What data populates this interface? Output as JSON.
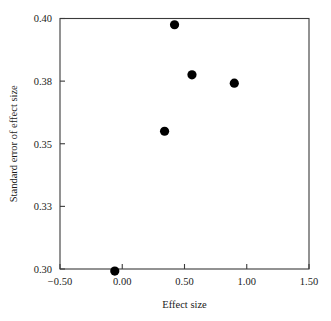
{
  "chart_data": {
    "type": "scatter",
    "title": "",
    "xlabel": "Effect size",
    "ylabel": "Standard error of effect size",
    "xlim": [
      -0.5,
      1.5
    ],
    "ylim": [
      0.3,
      0.4
    ],
    "y_axis_inverted": false,
    "grid": false,
    "legend": null,
    "legend_position": "none",
    "marker": "filled-circle",
    "marker_color": "#000000",
    "marker_size_px": 4.6,
    "xticks": [
      -0.5,
      0.0,
      0.5,
      1.0,
      1.5
    ],
    "xtick_labels": [
      "−0.50",
      "0.00",
      "0.50",
      "1.00",
      "1.50"
    ],
    "yticks": [
      0.3,
      0.33,
      0.35,
      0.38,
      0.4
    ],
    "ytick_labels": [
      "0.30",
      "0.33",
      "0.35",
      "0.38",
      "0.40"
    ],
    "points": [
      {
        "x": -0.06,
        "y": 0.299
      },
      {
        "x": 0.34,
        "y": 0.356
      },
      {
        "x": 0.42,
        "y": 0.398
      },
      {
        "x": 0.56,
        "y": 0.382
      },
      {
        "x": 0.9,
        "y": 0.379
      }
    ],
    "x": [
      -0.06,
      0.34,
      0.42,
      0.56,
      0.9
    ],
    "values": [
      0.299,
      0.356,
      0.398,
      0.382,
      0.379
    ]
  },
  "colors": {
    "background": "#ffffff",
    "axis": "#3a3a3a",
    "text": "#1a1a1a",
    "marker": "#000000"
  }
}
